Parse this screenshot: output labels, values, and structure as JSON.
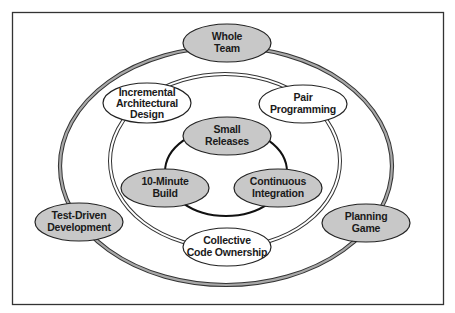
{
  "diagram": {
    "colors": {
      "frame": "#333333",
      "ring_gray": "#9a9a9a",
      "ring_line": "#333333",
      "shaded_node": "#c8c8c8",
      "plain_node": "#ffffff",
      "text": "#1a1a1a"
    },
    "outer_ring": {
      "label": "outer practices",
      "nodes": [
        {
          "id": "whole-team",
          "lines": [
            "Whole",
            "Team"
          ],
          "shaded": true
        },
        {
          "id": "test-driven-development",
          "lines": [
            "Test-Driven",
            "Development"
          ],
          "shaded": true
        },
        {
          "id": "planning-game",
          "lines": [
            "Planning",
            "Game"
          ],
          "shaded": true
        }
      ]
    },
    "middle_ring": {
      "nodes": [
        {
          "id": "incremental-architectural-design",
          "lines": [
            "Incremental",
            "Architectural",
            "Design"
          ],
          "shaded": false
        },
        {
          "id": "pair-programming",
          "lines": [
            "Pair",
            "Programming"
          ],
          "shaded": false
        },
        {
          "id": "collective-code-ownership",
          "lines": [
            "Collective",
            "Code Ownership"
          ],
          "shaded": false
        }
      ]
    },
    "inner_ring": {
      "nodes": [
        {
          "id": "small-releases",
          "lines": [
            "Small",
            "Releases"
          ],
          "shaded": true
        },
        {
          "id": "10-minute-build",
          "lines": [
            "10-Minute",
            "Build"
          ],
          "shaded": true
        },
        {
          "id": "continuous-integration",
          "lines": [
            "Continuous",
            "Integration"
          ],
          "shaded": true
        }
      ]
    }
  }
}
